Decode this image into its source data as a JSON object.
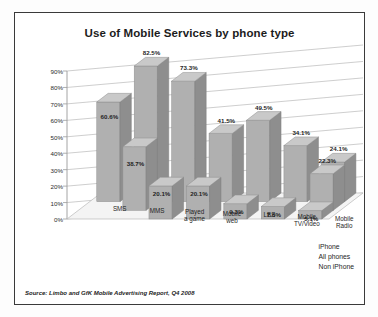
{
  "chart_data": {
    "type": "bar",
    "title": "Use of Mobile Services by phone type",
    "xlabel": "",
    "ylabel": "",
    "ylim": [
      0,
      90
    ],
    "ytick_labels": [
      "0%",
      "10%",
      "20%",
      "30%",
      "40%",
      "50%",
      "60%",
      "70%",
      "80%",
      "90%"
    ],
    "ytick_values": [
      0,
      10,
      20,
      30,
      40,
      50,
      60,
      70,
      80,
      90
    ],
    "grid": true,
    "legend_position": "bottom-right",
    "categories": [
      "SMS",
      "MMS",
      "Played a game",
      "Mobile web",
      "LBS",
      "Mobile TV/Video",
      "Mobile Radio"
    ],
    "series": [
      {
        "name": "iPhone",
        "values": [
          60.6,
          82.5,
          73.3,
          41.5,
          49.5,
          34.1,
          24.1
        ],
        "labels": [
          "60.6%",
          "82.5%",
          "73.3%",
          "41.5%",
          "49.5%",
          "34.1%",
          "24.1%"
        ]
      },
      {
        "name": "All phones",
        "values": [
          null,
          38.7,
          null,
          null,
          null,
          null,
          22.3
        ],
        "labels": [
          "",
          "38.7%",
          "",
          "",
          "",
          "",
          "22.3%"
        ]
      },
      {
        "name": "Non iPhone",
        "values": [
          null,
          null,
          20.1,
          20.1,
          9.3,
          7.6,
          5.1
        ],
        "labels": [
          "",
          "",
          "20.1%",
          "20.1%",
          "9.3%",
          "7.6%",
          "5.1%"
        ]
      }
    ],
    "visible_value_labels": [
      "60.6%",
      "82.5%",
      "38.7%",
      "73.3%",
      "20.1%",
      "41.5%",
      "20.1%",
      "49.5%",
      "9.3%",
      "34.1%",
      "7.6%",
      "24.1%",
      "5.1%",
      "22.3%"
    ],
    "colors": {
      "bar_front": "#b0b0b0",
      "bar_top": "#c9c9c9",
      "bar_side": "#8e8e8e",
      "grid": "#b9b9b9",
      "axis": "#9a9a9a",
      "text": "#1f1f1f",
      "frame": "#3a3a3a",
      "background": "#ffffff"
    }
  },
  "legend": {
    "items": [
      {
        "label": "iPhone"
      },
      {
        "label": "All phones"
      },
      {
        "label": "Non iPhone"
      }
    ]
  },
  "footer": {
    "source": "Source: Limbo and GfK Mobile Advertising Report, Q4 2008"
  }
}
